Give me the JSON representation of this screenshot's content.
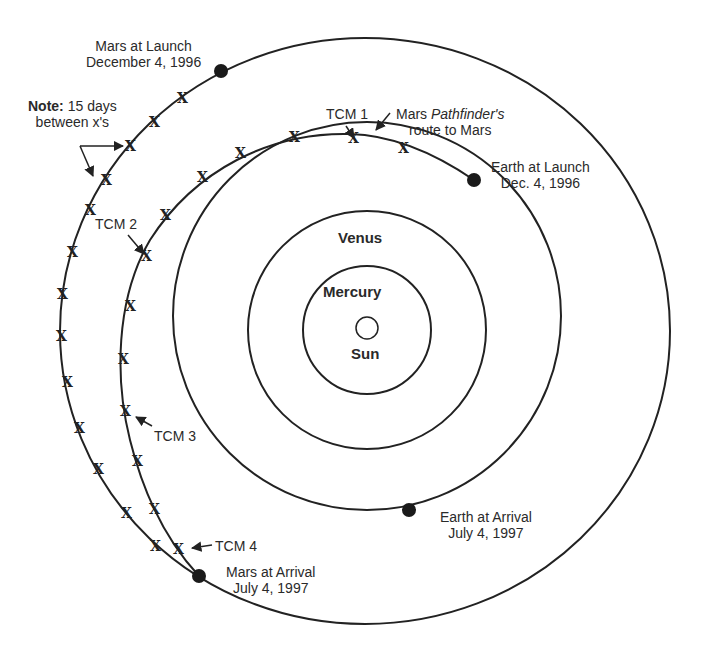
{
  "diagram": {
    "bodies": {
      "sun": "Sun",
      "mercury": "Mercury",
      "venus": "Venus"
    },
    "labels": {
      "mars_launch_1": "Mars at Launch",
      "mars_launch_2": "December 4, 1996",
      "earth_launch_1": "Earth at Launch",
      "earth_launch_2": "Dec. 4, 1996",
      "earth_arrival_1": "Earth at Arrival",
      "earth_arrival_2": "July 4, 1997",
      "mars_arrival_1": "Mars at Arrival",
      "mars_arrival_2": "July 4, 1997",
      "route_1a": "Mars ",
      "route_1b": "Pathfinder's",
      "route_2": "route to Mars",
      "note_bold": "Note:",
      "note_1": " 15 days",
      "note_2": "between x's",
      "tcm1": "TCM 1",
      "tcm2": "TCM 2",
      "tcm3": "TCM 3",
      "tcm4": "TCM 4"
    },
    "marker": "X",
    "colors": {
      "line": "#222222",
      "background": "#ffffff"
    }
  }
}
